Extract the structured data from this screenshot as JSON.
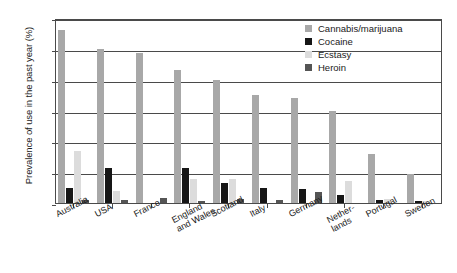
{
  "chart_data": {
    "type": "bar",
    "title": "",
    "xlabel": "",
    "ylabel": "Prevalence of use in the past year (%)",
    "ylim": [
      0,
      12
    ],
    "yticks": [
      0,
      2,
      4,
      6,
      8,
      10,
      12
    ],
    "grid": true,
    "legend_position": "top-right",
    "categories": [
      "Australia",
      "USA",
      "France",
      "England\nand Wales",
      "Scotland",
      "Italy",
      "Germany",
      "Nether-\nlands",
      "Portugal",
      "Sweden"
    ],
    "series": [
      {
        "name": "Cannabis/marijuana",
        "color": "#a8a8a8",
        "values": [
          11.2,
          10.0,
          9.7,
          8.6,
          8.0,
          7.0,
          6.8,
          6.0,
          3.2,
          1.9
        ]
      },
      {
        "name": "Cocaine",
        "color": "#161616",
        "values": [
          1.0,
          2.3,
          0.0,
          2.3,
          1.3,
          1.0,
          0.9,
          0.5,
          0.2,
          0.1
        ]
      },
      {
        "name": "Ecstasy",
        "color": "#dcdcdc",
        "values": [
          3.4,
          0.75,
          0.0,
          1.55,
          1.55,
          0.0,
          0.0,
          1.4,
          0.25,
          0.1
        ]
      },
      {
        "name": "Heroin",
        "color": "#555555",
        "values": [
          0.2,
          0.2,
          0.3,
          0.1,
          0.25,
          0.2,
          0.7,
          0.0,
          0.0,
          0.0
        ]
      }
    ]
  },
  "axis": {
    "y_tick_labels": [
      "12",
      "10",
      "8",
      "6",
      "4",
      "2",
      "0"
    ]
  },
  "legend": {
    "items": [
      {
        "label": "Cannabis/marijuana",
        "color": "#a8a8a8"
      },
      {
        "label": "Cocaine",
        "color": "#161616"
      },
      {
        "label": "Ecstasy",
        "color": "#dcdcdc"
      },
      {
        "label": "Heroin",
        "color": "#555555"
      }
    ]
  }
}
